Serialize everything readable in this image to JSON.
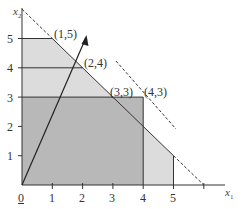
{
  "diagram": {
    "type": "linear-programming-feasible-region",
    "axes": {
      "x_label": "x",
      "x_sub": "1",
      "y_label": "x",
      "y_sub": "2",
      "origin_label": "0",
      "x_ticks": [
        "1",
        "2",
        "3",
        "4",
        "5"
      ],
      "y_ticks": [
        "1",
        "2",
        "3",
        "4",
        "5"
      ]
    },
    "points": [
      {
        "label": "(1,5)",
        "x": 1,
        "y": 5
      },
      {
        "label": "(2,4)",
        "x": 2,
        "y": 4
      },
      {
        "label": "(3,3)",
        "x": 3,
        "y": 3
      },
      {
        "label": "(4,3)",
        "x": 4,
        "y": 3
      }
    ],
    "regions": [
      {
        "name": "outer-light-region",
        "color": "#dcdcdc",
        "vertices": [
          [
            0,
            0
          ],
          [
            5,
            0
          ],
          [
            5,
            1
          ],
          [
            1,
            5
          ],
          [
            0,
            5
          ]
        ]
      },
      {
        "name": "inner-dark-region",
        "color": "#b8b8b8",
        "vertices": [
          [
            0,
            0
          ],
          [
            4,
            0
          ],
          [
            4,
            3
          ],
          [
            0,
            3
          ]
        ]
      }
    ],
    "lines": {
      "constraint_x1_plus_x2_6": {
        "from": [
          1,
          5
        ],
        "to": [
          5,
          1
        ],
        "style": "solid"
      },
      "dashed_extension_upper": {
        "from": [
          0,
          6
        ],
        "to": [
          1,
          5
        ],
        "style": "dashed"
      },
      "dashed_extension_lower": {
        "from": [
          5,
          1
        ],
        "to": [
          6,
          0
        ],
        "style": "dashed"
      },
      "objective_dashed": {
        "from": [
          3.5,
          4.4
        ],
        "to": [
          5.4,
          3.0
        ],
        "style": "dashed"
      },
      "horizontal_lines": [
        3,
        4,
        5
      ],
      "vertical_lines": [
        4,
        5
      ]
    },
    "arrow": {
      "from": [
        0,
        0
      ],
      "to": [
        2.1,
        5.0
      ]
    },
    "colors": {
      "light": "#dcdcdc",
      "dark": "#b8b8b8",
      "line": "#333333"
    }
  }
}
